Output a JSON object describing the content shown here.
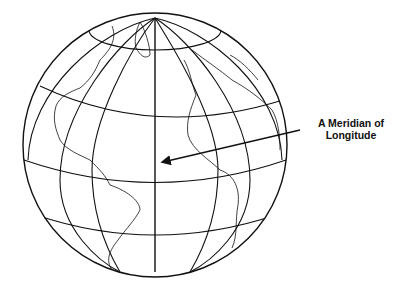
{
  "diagram": {
    "label": {
      "line1": "A Meridian of",
      "line2": "Longitude"
    },
    "colors": {
      "background": "#ffffff",
      "ink": "#111111"
    },
    "globe": {
      "center": [
        155,
        145
      ],
      "radius": 132
    }
  }
}
